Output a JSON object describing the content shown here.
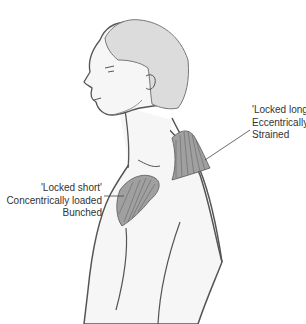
{
  "figure": {
    "colors": {
      "outline": "#555555",
      "fill": "#f4f4f4",
      "hair": "#dcdcdc",
      "muscle": "#8a8a8a",
      "text": "#333333"
    }
  },
  "labels": {
    "locked_long": {
      "line1": "'Locked long'",
      "line2": "Eccentrically loaded",
      "line3": "Strained"
    },
    "locked_short": {
      "line1": "'Locked short'",
      "line2": "Concentrically loaded",
      "line3": "Bunched"
    }
  }
}
